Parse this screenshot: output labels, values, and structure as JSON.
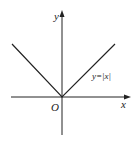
{
  "diagram": {
    "function_label": "y=|x|",
    "x_axis_label": "x",
    "y_axis_label": "y",
    "origin_label": "O",
    "colors": {
      "line": "#222222",
      "background": "#ffffff"
    }
  }
}
